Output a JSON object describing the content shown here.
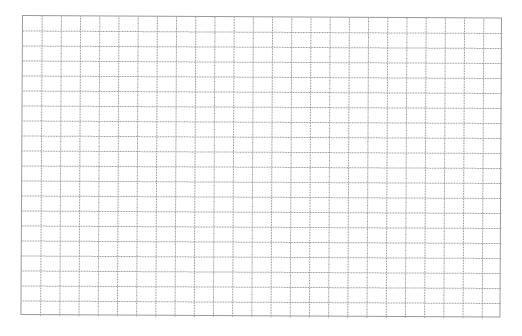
{
  "grid": {
    "columns": 25,
    "rows": 20,
    "cell_width": 19.2,
    "cell_height": 15,
    "line_color": "#9a9a9a",
    "background_color": "#ffffff"
  }
}
